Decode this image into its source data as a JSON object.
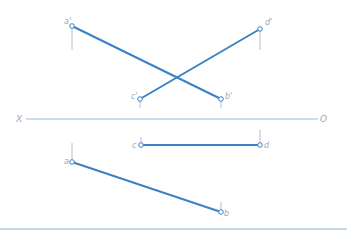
{
  "diagram": {
    "type": "orthographic projection of two skew lines",
    "colors": {
      "line": "#3b82c4",
      "axis": "#8fb0cf",
      "projector": "#a9b7c4",
      "label": "#9aa7b5",
      "point_stroke": "#3b82c4"
    },
    "axis": {
      "left_label": "X",
      "right_label": "O",
      "y": 119,
      "x1": 26,
      "x2": 318
    },
    "bottom_rule": {
      "y": 229,
      "x1": 0,
      "x2": 347
    },
    "points": {
      "a_prime": {
        "label": "a'",
        "x": 72,
        "y": 26,
        "tick_to": 50
      },
      "b_prime": {
        "label": "b'",
        "x": 221,
        "y": 99,
        "tick_to": 108
      },
      "c_prime": {
        "label": "c'",
        "x": 140,
        "y": 99,
        "tick_to": 108
      },
      "d_prime": {
        "label": "d'",
        "x": 260,
        "y": 29,
        "tick_to": 50
      },
      "a": {
        "label": "a",
        "x": 72,
        "y": 162,
        "tick_to": 143
      },
      "b": {
        "label": "b",
        "x": 221,
        "y": 212,
        "tick_to": 202
      },
      "c": {
        "label": "c",
        "x": 141,
        "y": 145,
        "tick_to": 137
      },
      "d": {
        "label": "d",
        "x": 260,
        "y": 145,
        "tick_to": 130
      }
    },
    "segments": [
      {
        "name": "a'b'",
        "from": "a_prime",
        "to": "b_prime"
      },
      {
        "name": "c'd'",
        "from": "c_prime",
        "to": "d_prime"
      },
      {
        "name": "ab",
        "from": "a",
        "to": "b"
      },
      {
        "name": "cd",
        "from": "c",
        "to": "d"
      }
    ]
  }
}
